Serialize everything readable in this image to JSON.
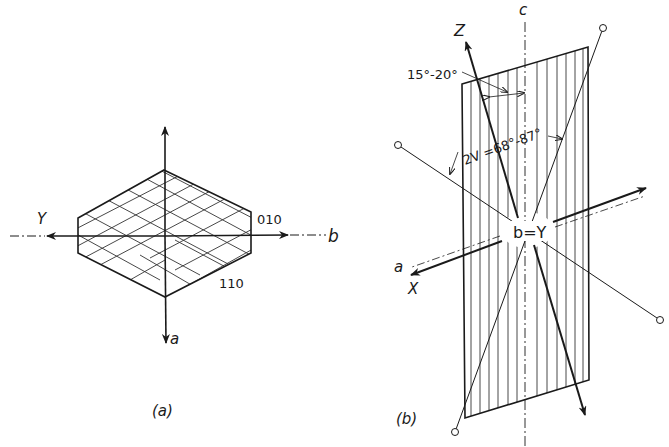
{
  "figure": {
    "panel_a": {
      "caption": "(a)",
      "axis_labels": {
        "top": "",
        "left": "Y",
        "right": "b",
        "bottom": "a"
      },
      "face_labels": {
        "face_010": "010",
        "face_110": "110"
      }
    },
    "panel_b": {
      "caption": "(b)",
      "axis_labels": {
        "c": "c",
        "z": "Z",
        "a": "a",
        "x": "X",
        "center": "b=Y"
      },
      "angle_labels": {
        "extinction": "15°-20°",
        "optic_angle": "2V =68°-87°"
      }
    },
    "colors": {
      "ink": "#1a1a1a",
      "background": "#ffffff"
    }
  }
}
